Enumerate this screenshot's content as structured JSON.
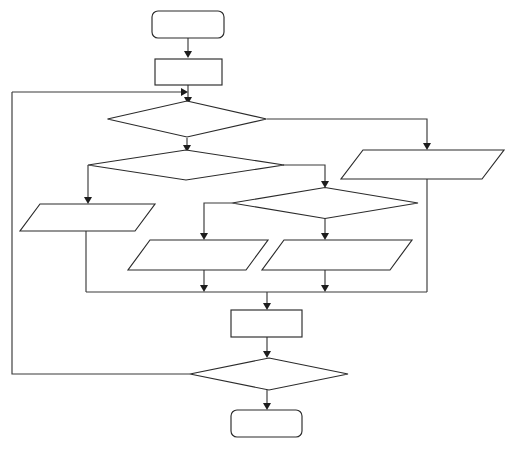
{
  "diagram": {
    "type": "flowchart",
    "background_color": "#ffffff",
    "stroke_color": "#2b2b2b",
    "connector_color": "#3a3a3a",
    "fill_color": "#ffffff",
    "canvas": {
      "width": 518,
      "height": 449
    }
  },
  "nodes": [
    {
      "id": "start",
      "name": "start-terminal",
      "shape": "rounded-rectangle",
      "label": "",
      "x": 152,
      "y": 11,
      "w": 72,
      "h": 27,
      "rx": 6
    },
    {
      "id": "process-init",
      "name": "process-initialize",
      "shape": "rectangle",
      "label": "",
      "x": 155,
      "y": 59,
      "w": 67,
      "h": 26
    },
    {
      "id": "decision-1",
      "name": "decision-primary",
      "shape": "diamond",
      "label": "",
      "cx": 187,
      "cy": 119,
      "w": 159,
      "h": 36
    },
    {
      "id": "decision-2",
      "name": "decision-secondary",
      "shape": "diamond",
      "label": "",
      "cx": 186,
      "cy": 165,
      "w": 196,
      "h": 30
    },
    {
      "id": "io-right",
      "name": "io-right-parallelogram",
      "shape": "parallelogram",
      "label": "",
      "x": 341,
      "y": 150,
      "w": 163,
      "h": 29,
      "skew": 22
    },
    {
      "id": "io-left",
      "name": "io-left-parallelogram",
      "shape": "parallelogram",
      "label": "",
      "x": 20,
      "y": 204,
      "w": 135,
      "h": 27,
      "skew": 20
    },
    {
      "id": "decision-3",
      "name": "decision-tertiary",
      "shape": "diamond",
      "label": "",
      "cx": 325,
      "cy": 203,
      "w": 186,
      "h": 31
    },
    {
      "id": "io-mid-left",
      "name": "io-mid-left-parallelogram",
      "shape": "parallelogram",
      "label": "",
      "x": 128,
      "y": 240,
      "w": 140,
      "h": 30,
      "skew": 22
    },
    {
      "id": "io-mid-right",
      "name": "io-mid-right-parallelogram",
      "shape": "parallelogram",
      "label": "",
      "x": 262,
      "y": 240,
      "w": 150,
      "h": 30,
      "skew": 22
    },
    {
      "id": "process-merge",
      "name": "process-merge",
      "shape": "rectangle",
      "label": "",
      "x": 231,
      "y": 310,
      "w": 71,
      "h": 27
    },
    {
      "id": "decision-loop",
      "name": "decision-loop-back",
      "shape": "diamond",
      "label": "",
      "cx": 269,
      "cy": 374,
      "w": 158,
      "h": 32
    },
    {
      "id": "end",
      "name": "end-terminal",
      "shape": "rounded-rectangle",
      "label": "",
      "x": 231,
      "y": 410,
      "w": 71,
      "h": 27,
      "rx": 6
    }
  ],
  "edges": [
    {
      "id": "e-start-init",
      "name": "edge-start-to-init",
      "path": "M 188 38 L 188 55",
      "arrow": "down",
      "arrow_at": [
        188,
        58
      ],
      "label": ""
    },
    {
      "id": "e-init-d1",
      "name": "edge-init-to-decision1",
      "path": "M 188 85 L 188 101",
      "arrow": "down",
      "arrow_at": [
        188,
        104
      ],
      "label": ""
    },
    {
      "id": "e-loopback",
      "name": "edge-loopback-to-decision1",
      "path": "M 12 92 L 183 92",
      "arrow": "right",
      "arrow_at": [
        188,
        92
      ],
      "label": ""
    },
    {
      "id": "e-loopback-vert",
      "name": "edge-loopback-vertical",
      "path": "M 12 92 L 12 374 L 190 374",
      "arrow": "none",
      "label": ""
    },
    {
      "id": "e-d1-d2",
      "name": "edge-decision1-to-decision2",
      "path": "M 187 138 L 187 149",
      "arrow": "down",
      "arrow_at": [
        187,
        152
      ],
      "label": ""
    },
    {
      "id": "e-d1-ioright",
      "name": "edge-decision1-to-io-right",
      "path": "M 267 119 L 427 119 L 427 146",
      "arrow": "down",
      "arrow_at": [
        427,
        150
      ],
      "label": ""
    },
    {
      "id": "e-d2-ioleft",
      "name": "edge-decision2-to-io-left",
      "path": "M 88 165 L 88 200",
      "arrow": "down",
      "arrow_at": [
        88,
        204
      ],
      "label": ""
    },
    {
      "id": "e-d2-d3",
      "name": "edge-decision2-to-decision3",
      "path": "M 283 165 L 325 165 L 325 184",
      "arrow": "down",
      "arrow_at": [
        325,
        188
      ],
      "label": ""
    },
    {
      "id": "e-d3-iomidleft",
      "name": "edge-decision3-to-io-mid-left",
      "path": "M 232 203 L 204 203 L 204 236",
      "arrow": "down",
      "arrow_at": [
        204,
        240
      ],
      "label": ""
    },
    {
      "id": "e-d3-iomidright",
      "name": "edge-decision3-to-io-mid-right",
      "path": "M 325 218 L 325 236",
      "arrow": "down",
      "arrow_at": [
        325,
        240
      ],
      "label": ""
    },
    {
      "id": "e-ioleft-bus",
      "name": "edge-io-left-to-bus",
      "path": "M 86 231 L 86 292",
      "arrow": "none",
      "label": ""
    },
    {
      "id": "e-ioright-bus",
      "name": "edge-io-right-to-bus",
      "path": "M 427 179 L 427 292",
      "arrow": "none",
      "label": ""
    },
    {
      "id": "e-bus",
      "name": "edge-merge-bus",
      "path": "M 86 292 L 427 292",
      "arrow": "none",
      "label": ""
    },
    {
      "id": "e-iomidleft-bus",
      "name": "edge-io-mid-left-to-bus",
      "path": "M 204 270 L 204 288",
      "arrow": "down",
      "arrow_at": [
        204,
        292
      ],
      "label": ""
    },
    {
      "id": "e-iomidright-bus",
      "name": "edge-io-mid-right-to-bus",
      "path": "M 325 270 L 325 288",
      "arrow": "down",
      "arrow_at": [
        325,
        292
      ],
      "label": ""
    },
    {
      "id": "e-bus-merge",
      "name": "edge-bus-to-process-merge",
      "path": "M 267 292 L 267 306",
      "arrow": "down",
      "arrow_at": [
        267,
        310
      ],
      "label": ""
    },
    {
      "id": "e-merge-dloop",
      "name": "edge-merge-to-decision-loop",
      "path": "M 267 337 L 267 354",
      "arrow": "down",
      "arrow_at": [
        267,
        358
      ],
      "label": ""
    },
    {
      "id": "e-dloop-end",
      "name": "edge-decision-loop-to-end",
      "path": "M 267 390 L 267 406",
      "arrow": "down",
      "arrow_at": [
        267,
        410
      ],
      "label": ""
    }
  ]
}
